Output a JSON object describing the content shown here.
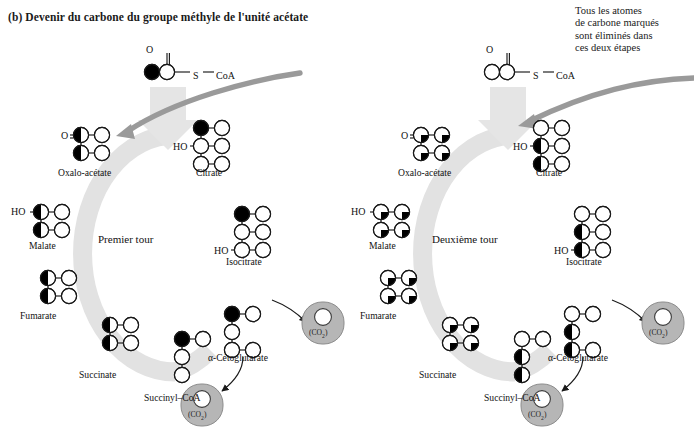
{
  "figure": {
    "panel_label": "(b) Devenir du carbone du groupe méthyle de l'unité acétate",
    "annotation": "Tous les atomes\nde carbone marqués\nsont éliminés dans\nces deux étapes",
    "background": "#ffffff",
    "ring_color": "#e0e0e0",
    "arrow_color": "#9a9a9a",
    "co2_color": "#b5b5b5",
    "atom_fill_marked": "#000000",
    "atom_fill_plain": "#ffffff",
    "stroke": "#1a1a1a"
  },
  "substrates": [
    {
      "name": "acetyl-coa-left",
      "sulfur": "S",
      "coa": "CoA",
      "oxygen": "O"
    },
    {
      "name": "acetyl-coa-right",
      "sulfur": "S",
      "coa": "CoA",
      "oxygen": "O"
    }
  ],
  "cycles": [
    {
      "id": "premier-tour",
      "title": "Premier tour",
      "intermediates": [
        {
          "label": "Oxalo-acétate",
          "side_group": "O"
        },
        {
          "label": "Citrate",
          "side_group": "HO"
        },
        {
          "label": "Isocitrate",
          "side_group": "HO"
        },
        {
          "label": "α-Cétoglutarate",
          "side_group": ""
        },
        {
          "label": "Succinyl–CoA",
          "side_group": ""
        },
        {
          "label": "Succinate",
          "side_group": ""
        },
        {
          "label": "Fumarate",
          "side_group": ""
        },
        {
          "label": "Malate",
          "side_group": "HO"
        }
      ],
      "co2_releases": [
        {
          "label": "(CO",
          "sub": "2",
          "tail": ")"
        },
        {
          "label": "(CO",
          "sub": "2",
          "tail": ")"
        }
      ]
    },
    {
      "id": "deuxieme-tour",
      "title": "Deuxième tour",
      "intermediates": [
        {
          "label": "Oxalo-acétate",
          "side_group": "O"
        },
        {
          "label": "Citrate",
          "side_group": "HO"
        },
        {
          "label": "Isocitrate",
          "side_group": "HO"
        },
        {
          "label": "α-Cétoglutarate",
          "side_group": ""
        },
        {
          "label": "Succinyl–CoA",
          "side_group": ""
        },
        {
          "label": "Succinate",
          "side_group": ""
        },
        {
          "label": "Fumarate",
          "side_group": ""
        },
        {
          "label": "Malate",
          "side_group": "HO"
        }
      ],
      "co2_releases": [
        {
          "label": "(CO",
          "sub": "2",
          "tail": ")"
        },
        {
          "label": "(CO",
          "sub": "2",
          "tail": ")"
        }
      ]
    }
  ],
  "co2_text": "(CO2)"
}
